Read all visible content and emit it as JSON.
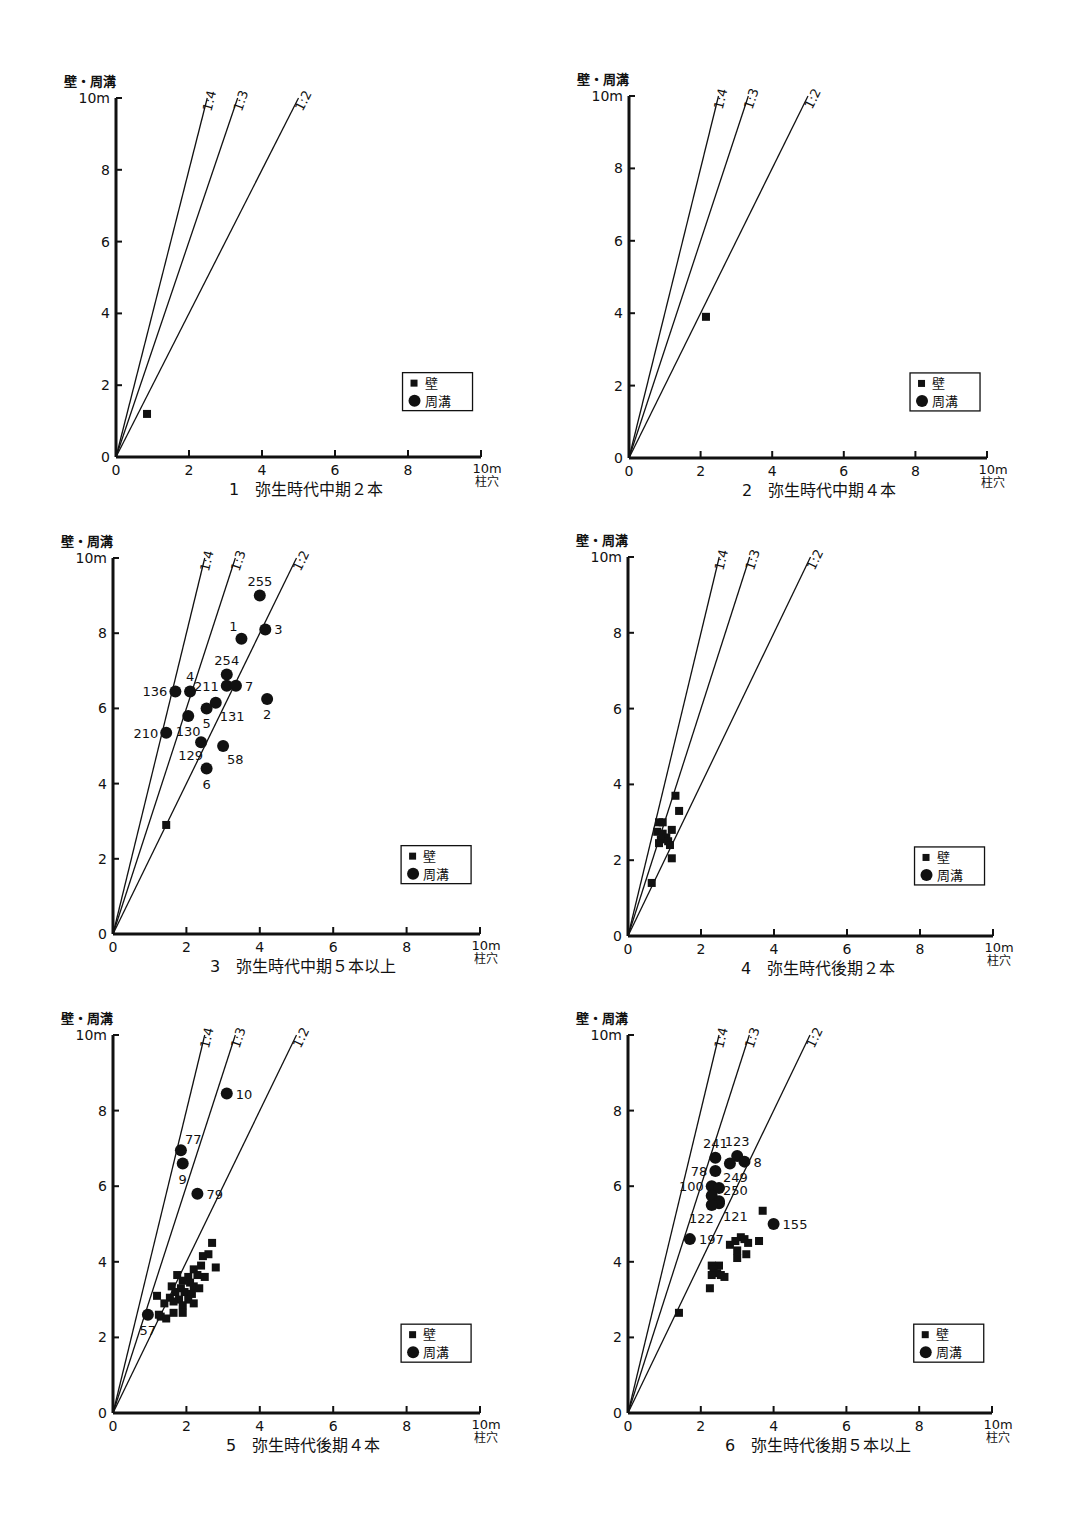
{
  "page": {
    "y_axis_title": "壁・周溝",
    "x_axis_unit_top": "10m",
    "x_axis_title": "柱穴",
    "y_top_label": "10m",
    "legend": {
      "wall": "壁",
      "trench": "周溝"
    },
    "ratio_lines": [
      "1:4",
      "1:3",
      "1:2"
    ]
  },
  "chart_data": [
    {
      "id": 1,
      "type": "scatter",
      "title": "1　弥生時代中期２本",
      "xlabel": "柱穴",
      "ylabel": "壁・周溝",
      "xlim": [
        0,
        10
      ],
      "ylim": [
        0,
        10
      ],
      "xticks": [
        0,
        2,
        4,
        6,
        8,
        10
      ],
      "yticks": [
        0,
        2,
        4,
        6,
        8,
        10
      ],
      "reference_lines": [
        {
          "label": "1:4",
          "slope": 4
        },
        {
          "label": "1:3",
          "slope": 3
        },
        {
          "label": "1:2",
          "slope": 2
        }
      ],
      "legend": [
        "壁",
        "周溝"
      ],
      "series": [
        {
          "name": "壁",
          "marker": "square",
          "points": [
            [
              0.85,
              1.2
            ]
          ]
        },
        {
          "name": "周溝",
          "marker": "circle",
          "points": []
        }
      ]
    },
    {
      "id": 2,
      "type": "scatter",
      "title": "2　弥生時代中期４本",
      "xlabel": "柱穴",
      "ylabel": "壁・周溝",
      "xlim": [
        0,
        10
      ],
      "ylim": [
        0,
        10
      ],
      "xticks": [
        0,
        2,
        4,
        6,
        8,
        10
      ],
      "yticks": [
        0,
        2,
        4,
        6,
        8,
        10
      ],
      "reference_lines": [
        {
          "label": "1:4",
          "slope": 4
        },
        {
          "label": "1:3",
          "slope": 3
        },
        {
          "label": "1:2",
          "slope": 2
        }
      ],
      "legend": [
        "壁",
        "周溝"
      ],
      "series": [
        {
          "name": "壁",
          "marker": "square",
          "points": [
            [
              2.15,
              3.9
            ]
          ]
        },
        {
          "name": "周溝",
          "marker": "circle",
          "points": []
        }
      ]
    },
    {
      "id": 3,
      "type": "scatter",
      "title": "3　弥生時代中期５本以上",
      "xlabel": "柱穴",
      "ylabel": "壁・周溝",
      "xlim": [
        0,
        10
      ],
      "ylim": [
        0,
        10
      ],
      "xticks": [
        0,
        2,
        4,
        6,
        8,
        10
      ],
      "yticks": [
        0,
        2,
        4,
        6,
        8,
        10
      ],
      "reference_lines": [
        {
          "label": "1:4",
          "slope": 4
        },
        {
          "label": "1:3",
          "slope": 3
        },
        {
          "label": "1:2",
          "slope": 2
        }
      ],
      "legend": [
        "壁",
        "周溝"
      ],
      "series": [
        {
          "name": "壁",
          "marker": "square",
          "points": [
            [
              1.45,
              2.9
            ]
          ]
        },
        {
          "name": "周溝",
          "marker": "circle",
          "points": [
            [
              4.0,
              9.0,
              "255",
              "above"
            ],
            [
              3.5,
              7.85,
              "1",
              "upleft"
            ],
            [
              4.15,
              8.1,
              "3",
              "right"
            ],
            [
              3.1,
              6.9,
              "254",
              "above"
            ],
            [
              3.1,
              6.6,
              "211",
              "left"
            ],
            [
              3.35,
              6.6,
              "7",
              "right"
            ],
            [
              1.7,
              6.45,
              "136",
              "left"
            ],
            [
              2.1,
              6.45,
              "4",
              "above"
            ],
            [
              4.2,
              6.25,
              "2",
              "below"
            ],
            [
              2.8,
              6.15,
              "131",
              "belowright"
            ],
            [
              2.55,
              6.0,
              "5",
              "below"
            ],
            [
              2.05,
              5.8,
              "130",
              "below"
            ],
            [
              1.45,
              5.35,
              "210",
              "left"
            ],
            [
              2.4,
              5.1,
              "129",
              "belowleft"
            ],
            [
              3.0,
              5.0,
              "58",
              "belowright"
            ],
            [
              2.55,
              4.4,
              "6",
              "below"
            ]
          ]
        }
      ]
    },
    {
      "id": 4,
      "type": "scatter",
      "title": "4　弥生時代後期２本",
      "xlabel": "柱穴",
      "ylabel": "壁・周溝",
      "xlim": [
        0,
        10
      ],
      "ylim": [
        0,
        10
      ],
      "xticks": [
        0,
        2,
        4,
        6,
        8,
        10
      ],
      "yticks": [
        0,
        2,
        4,
        6,
        8,
        10
      ],
      "reference_lines": [
        {
          "label": "1:4",
          "slope": 4
        },
        {
          "label": "1:3",
          "slope": 3
        },
        {
          "label": "1:2",
          "slope": 2
        }
      ],
      "legend": [
        "壁",
        "周溝"
      ],
      "series": [
        {
          "name": "壁",
          "marker": "square",
          "points": [
            [
              1.3,
              3.7
            ],
            [
              1.4,
              3.3
            ],
            [
              0.85,
              3.0
            ],
            [
              0.95,
              3.0
            ],
            [
              1.2,
              2.8
            ],
            [
              0.8,
              2.75
            ],
            [
              0.95,
              2.7
            ],
            [
              1.05,
              2.6
            ],
            [
              0.9,
              2.55
            ],
            [
              1.1,
              2.5
            ],
            [
              0.85,
              2.45
            ],
            [
              1.15,
              2.4
            ],
            [
              1.2,
              2.05
            ],
            [
              0.65,
              1.4
            ]
          ]
        },
        {
          "name": "周溝",
          "marker": "circle",
          "points": []
        }
      ]
    },
    {
      "id": 5,
      "type": "scatter",
      "title": "5　弥生時代後期４本",
      "xlabel": "柱穴",
      "ylabel": "壁・周溝",
      "xlim": [
        0,
        10
      ],
      "ylim": [
        0,
        10
      ],
      "xticks": [
        0,
        2,
        4,
        6,
        8,
        10
      ],
      "yticks": [
        0,
        2,
        4,
        6,
        8,
        10
      ],
      "reference_lines": [
        {
          "label": "1:4",
          "slope": 4
        },
        {
          "label": "1:3",
          "slope": 3
        },
        {
          "label": "1:2",
          "slope": 2
        }
      ],
      "legend": [
        "壁",
        "周溝"
      ],
      "series": [
        {
          "name": "壁",
          "marker": "square",
          "points": [
            [
              2.7,
              4.5
            ],
            [
              2.6,
              4.2
            ],
            [
              2.45,
              4.15
            ],
            [
              2.4,
              3.9
            ],
            [
              2.8,
              3.85
            ],
            [
              2.2,
              3.8
            ],
            [
              1.75,
              3.65
            ],
            [
              2.05,
              3.6
            ],
            [
              2.3,
              3.65
            ],
            [
              2.5,
              3.6
            ],
            [
              1.9,
              3.5
            ],
            [
              2.1,
              3.45
            ],
            [
              1.6,
              3.35
            ],
            [
              1.85,
              3.3
            ],
            [
              2.2,
              3.35
            ],
            [
              2.35,
              3.3
            ],
            [
              1.7,
              3.2
            ],
            [
              1.95,
              3.2
            ],
            [
              2.15,
              3.15
            ],
            [
              1.2,
              3.1
            ],
            [
              1.55,
              3.05
            ],
            [
              1.8,
              3.0
            ],
            [
              2.05,
              3.0
            ],
            [
              1.65,
              2.95
            ],
            [
              1.4,
              2.9
            ],
            [
              1.9,
              2.85
            ],
            [
              2.2,
              2.9
            ],
            [
              1.3,
              2.55
            ],
            [
              1.45,
              2.5
            ],
            [
              1.65,
              2.65
            ],
            [
              1.9,
              2.65
            ],
            [
              1.25,
              2.6
            ]
          ]
        },
        {
          "name": "周溝",
          "marker": "circle",
          "points": [
            [
              3.1,
              8.45,
              "10",
              "right"
            ],
            [
              1.85,
              6.95,
              "77",
              "aboveright"
            ],
            [
              1.9,
              6.6,
              "9",
              "below"
            ],
            [
              2.3,
              5.8,
              "79",
              "right"
            ],
            [
              0.95,
              2.6,
              "57",
              "below"
            ]
          ]
        }
      ]
    },
    {
      "id": 6,
      "type": "scatter",
      "title": "6　弥生時代後期５本以上",
      "xlabel": "柱穴",
      "ylabel": "壁・周溝",
      "xlim": [
        0,
        10
      ],
      "ylim": [
        0,
        10
      ],
      "xticks": [
        0,
        2,
        4,
        6,
        8,
        10
      ],
      "yticks": [
        0,
        2,
        4,
        6,
        8,
        10
      ],
      "reference_lines": [
        {
          "label": "1:4",
          "slope": 4
        },
        {
          "label": "1:3",
          "slope": 3
        },
        {
          "label": "1:2",
          "slope": 2
        }
      ],
      "legend": [
        "壁",
        "周溝"
      ],
      "series": [
        {
          "name": "壁",
          "marker": "square",
          "points": [
            [
              3.7,
              5.35
            ],
            [
              3.6,
              4.55
            ],
            [
              3.1,
              4.65
            ],
            [
              3.2,
              4.6
            ],
            [
              3.3,
              4.5
            ],
            [
              2.95,
              4.55
            ],
            [
              2.8,
              4.45
            ],
            [
              3.0,
              4.3
            ],
            [
              3.25,
              4.2
            ],
            [
              3.0,
              4.1
            ],
            [
              2.3,
              3.9
            ],
            [
              2.5,
              3.9
            ],
            [
              2.35,
              3.8
            ],
            [
              2.45,
              3.7
            ],
            [
              2.3,
              3.65
            ],
            [
              2.55,
              3.65
            ],
            [
              2.65,
              3.6
            ],
            [
              2.25,
              3.3
            ],
            [
              1.4,
              2.65
            ]
          ]
        },
        {
          "name": "周溝",
          "marker": "circle",
          "points": [
            [
              2.4,
              6.75,
              "241",
              "above"
            ],
            [
              3.0,
              6.8,
              "123",
              "above"
            ],
            [
              3.2,
              6.65,
              "8",
              "right"
            ],
            [
              2.8,
              6.6,
              "",
              "none"
            ],
            [
              2.4,
              6.4,
              "78",
              "left"
            ],
            [
              2.3,
              6.0,
              "100",
              "left"
            ],
            [
              2.5,
              5.95,
              "249",
              "aboveright"
            ],
            [
              2.3,
              5.75,
              "",
              "none"
            ],
            [
              2.5,
              5.6,
              "250",
              "aboveright"
            ],
            [
              2.5,
              5.55,
              "121",
              "belowright"
            ],
            [
              2.3,
              5.5,
              "122",
              "belowleft"
            ],
            [
              4.0,
              5.0,
              "155",
              "right"
            ],
            [
              1.7,
              4.6,
              "197",
              "right"
            ]
          ]
        }
      ]
    }
  ],
  "layout": [
    {
      "ox": 116,
      "oy": 457,
      "px10": 365,
      "py10": 359
    },
    {
      "ox": 629,
      "oy": 458,
      "px10": 358,
      "py10": 362
    },
    {
      "ox": 113,
      "oy": 934,
      "px10": 367,
      "py10": 376
    },
    {
      "ox": 628,
      "oy": 936,
      "px10": 365,
      "py10": 379
    },
    {
      "ox": 113,
      "oy": 1413,
      "px10": 367,
      "py10": 378
    },
    {
      "ox": 628,
      "oy": 1413,
      "px10": 364,
      "py10": 378
    }
  ]
}
